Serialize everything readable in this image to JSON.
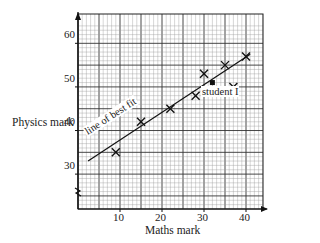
{
  "chart_data": {
    "type": "scatter",
    "title": "",
    "xlabel": "Maths mark",
    "ylabel": "Physics mark",
    "xlim": [
      0,
      44
    ],
    "ylim": [
      22,
      64
    ],
    "y_axis_break": true,
    "grid": true,
    "x_ticks": [
      10,
      20,
      30,
      40
    ],
    "y_ticks": [
      30,
      40,
      50,
      60
    ],
    "series": [
      {
        "name": "students",
        "marker": "x",
        "points": [
          {
            "x": 9,
            "y": 35
          },
          {
            "x": 15,
            "y": 42
          },
          {
            "x": 22,
            "y": 45
          },
          {
            "x": 28,
            "y": 48
          },
          {
            "x": 30,
            "y": 53
          },
          {
            "x": 35,
            "y": 55
          },
          {
            "x": 37,
            "y": 50
          },
          {
            "x": 40,
            "y": 57
          }
        ]
      },
      {
        "name": "student I",
        "marker": "square",
        "points": [
          {
            "x": 32,
            "y": 51
          }
        ]
      }
    ],
    "line_of_best_fit": {
      "x1": 2.4,
      "y1": 33,
      "x2": 41,
      "y2": 57.5
    },
    "annotations": [
      {
        "text": "line of best fit",
        "x": 6,
        "y": 37
      },
      {
        "text": "student I",
        "x": 32,
        "y": 46
      }
    ]
  },
  "labels": {
    "xlabel": "Maths mark",
    "ylabel": "Physics mark",
    "line_label": "line of best fit",
    "student_label": "student I",
    "xt": [
      "10",
      "20",
      "30",
      "40"
    ],
    "yt": [
      "60",
      "50",
      "40",
      "30"
    ]
  }
}
